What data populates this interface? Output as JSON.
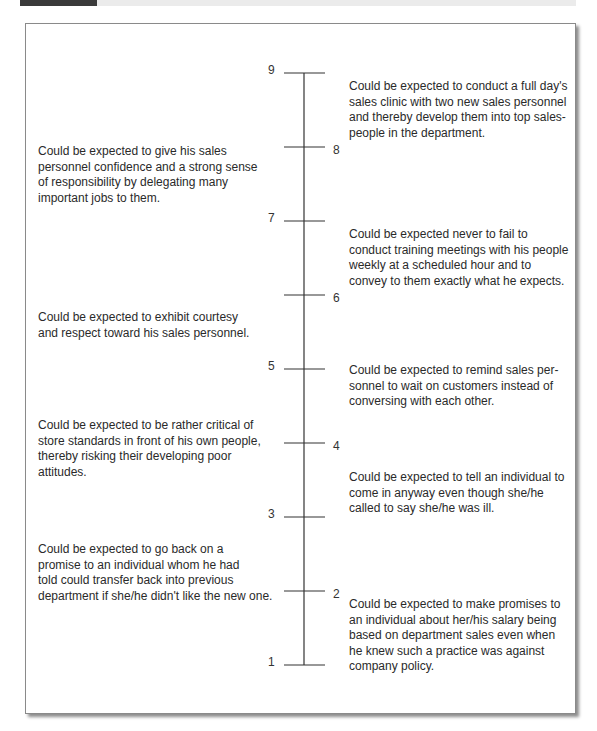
{
  "scale": {
    "min": 1,
    "max": 9,
    "ticks": [
      {
        "value": 9,
        "label_side": "left"
      },
      {
        "value": 8,
        "label_side": "right"
      },
      {
        "value": 7,
        "label_side": "left"
      },
      {
        "value": 6,
        "label_side": "right"
      },
      {
        "value": 5,
        "label_side": "left"
      },
      {
        "value": 4,
        "label_side": "right"
      },
      {
        "value": 3,
        "label_side": "left"
      },
      {
        "value": 2,
        "label_side": "right"
      },
      {
        "value": 1,
        "label_side": "left"
      }
    ]
  },
  "anchors": [
    {
      "side": "right",
      "near_value": 9,
      "lines": [
        "Could be expected to conduct a full day's",
        "sales clinic with two new sales personnel",
        "and thereby develop them into top sales-",
        "people in the department."
      ]
    },
    {
      "side": "left",
      "near_value": 8,
      "lines": [
        "Could be expected to give his sales",
        "personnel confidence and a strong sense",
        "of responsibility by delegating many",
        "important jobs to them."
      ]
    },
    {
      "side": "right",
      "near_value": 7,
      "lines": [
        "Could be expected never to fail to",
        "conduct training meetings with his people",
        "weekly at a scheduled hour and to",
        "convey to them exactly what he expects."
      ]
    },
    {
      "side": "left",
      "near_value": 6,
      "lines": [
        "Could be expected to exhibit courtesy",
        "and respect toward his sales personnel."
      ]
    },
    {
      "side": "right",
      "near_value": 5,
      "lines": [
        "Could be expected to remind sales per-",
        "sonnel to wait on customers instead of",
        "conversing with each other."
      ]
    },
    {
      "side": "left",
      "near_value": 4,
      "lines": [
        "Could be expected to be rather critical of",
        "store standards in front of his own people,",
        "thereby risking their developing poor",
        "attitudes."
      ]
    },
    {
      "side": "right",
      "near_value": 3.5,
      "lines": [
        "Could be expected to tell an individual to",
        "come in anyway even though she/he",
        "called to say she/he was ill."
      ]
    },
    {
      "side": "left",
      "near_value": 2,
      "lines": [
        "Could be expected to go back on a",
        "promise to an individual whom he had",
        "told could transfer back into previous",
        "department if she/he didn't like the new one."
      ]
    },
    {
      "side": "right",
      "near_value": 1.5,
      "lines": [
        "Could be expected to make promises to",
        "an individual about her/his salary being",
        "based on department sales even when",
        "he knew such a practice was against",
        "company policy."
      ]
    }
  ],
  "colors": {
    "line": "#333333",
    "text": "#2a2a2a"
  }
}
